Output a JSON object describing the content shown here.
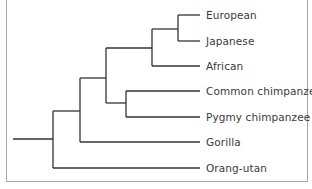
{
  "diagram": {
    "type": "phylogenetic-tree",
    "taxa": [
      {
        "label": "European",
        "y": 15
      },
      {
        "label": "Japanese",
        "y": 41
      },
      {
        "label": "African",
        "y": 66
      },
      {
        "label": "Common chimpanzee",
        "y": 91
      },
      {
        "label": "Pygmy chimpanzee",
        "y": 117
      },
      {
        "label": "Gorilla",
        "y": 142
      },
      {
        "label": "Orang-utan",
        "y": 168
      }
    ],
    "line_color": "#333333",
    "frame_color": "#a8a8a8"
  }
}
